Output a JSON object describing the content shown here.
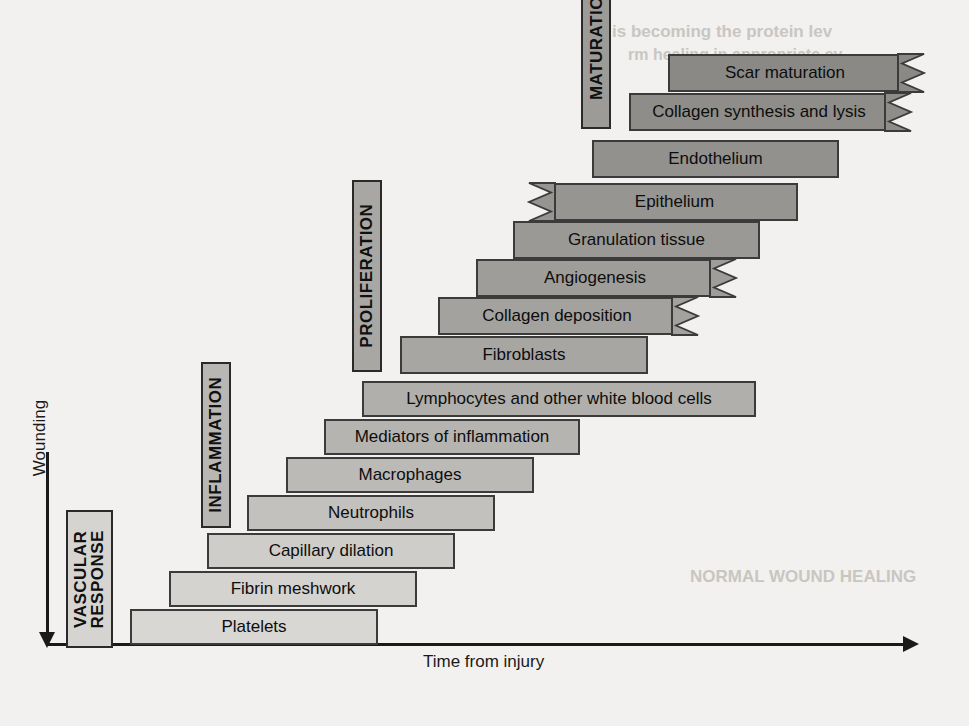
{
  "axes": {
    "y_label": "Wounding",
    "x_label": "Time from injury"
  },
  "phases": [
    {
      "id": "vascular-response",
      "label": "VASCULAR\nRESPONSE",
      "line1": "VASCULAR",
      "line2": "RESPONSE",
      "x": 66,
      "y": 510,
      "w": 47,
      "h": 138,
      "fill": "#d6d4d1",
      "font_size": 17
    },
    {
      "id": "inflammation",
      "label": "INFLAMMATION",
      "line1": "INFLAMMATION",
      "line2": "",
      "x": 201,
      "y": 362,
      "w": 30,
      "h": 166,
      "fill": "#b9b7b4",
      "font_size": 17
    },
    {
      "id": "proliferation",
      "label": "PROLIFERATION",
      "line1": "PROLIFERATION",
      "line2": "",
      "x": 352,
      "y": 180,
      "w": 30,
      "h": 192,
      "fill": "#a9a7a4",
      "font_size": 17
    },
    {
      "id": "maturation",
      "label": "MATURATION",
      "line1": "MATURATION",
      "line2": "",
      "x": 581,
      "y": -46,
      "w": 30,
      "h": 175,
      "fill": "#9d9b98",
      "font_size": 17
    }
  ],
  "chart_data": {
    "type": "bar",
    "xlabel": "Time from injury",
    "ylabel": "Wounding",
    "orientation": "horizontal-gantt",
    "grid": false,
    "legend": "none",
    "note": "Overlapping horizontal bars forming a staircase; bars darken with later stages; zigzag edges denote continuation beyond the plotted range.",
    "categories": [
      "Platelets",
      "Fibrin meshwork",
      "Capillary dilation",
      "Neutrophils",
      "Macrophages",
      "Mediators of inflammation",
      "Lymphocytes and other white blood cells",
      "Fibroblasts",
      "Collagen deposition",
      "Angiogenesis",
      "Granulation tissue",
      "Epithelium",
      "Endothelium",
      "Collagen synthesis and lysis",
      "Scar maturation"
    ],
    "bars": [
      {
        "label": "Platelets",
        "x": 130,
        "y": 609,
        "w": 248,
        "h": 36,
        "fill": "#d9d7d4",
        "font_size": 17,
        "zig_right": false,
        "zig_left": false,
        "phase": "vascular-response"
      },
      {
        "label": "Fibrin meshwork",
        "x": 169,
        "y": 571,
        "w": 248,
        "h": 36,
        "fill": "#d5d3d0",
        "font_size": 17,
        "zig_right": false,
        "zig_left": false,
        "phase": "vascular-response"
      },
      {
        "label": "Capillary dilation",
        "x": 207,
        "y": 533,
        "w": 248,
        "h": 36,
        "fill": "#cfcdc9",
        "font_size": 17,
        "zig_right": false,
        "zig_left": false,
        "phase": "vascular-response"
      },
      {
        "label": "Neutrophils",
        "x": 247,
        "y": 495,
        "w": 248,
        "h": 36,
        "fill": "#c3c1bd",
        "font_size": 17,
        "zig_right": false,
        "zig_left": false,
        "phase": "inflammation"
      },
      {
        "label": "Macrophages",
        "x": 286,
        "y": 457,
        "w": 248,
        "h": 36,
        "fill": "#bcbab6",
        "font_size": 17,
        "zig_right": false,
        "zig_left": false,
        "phase": "inflammation"
      },
      {
        "label": "Mediators of inflammation",
        "x": 324,
        "y": 419,
        "w": 256,
        "h": 36,
        "fill": "#b6b4b0",
        "font_size": 17,
        "zig_right": false,
        "zig_left": false,
        "phase": "inflammation"
      },
      {
        "label": "Lymphocytes and other white blood cells",
        "x": 362,
        "y": 381,
        "w": 394,
        "h": 36,
        "fill": "#b1afab",
        "font_size": 17,
        "zig_right": false,
        "zig_left": false,
        "phase": "inflammation"
      },
      {
        "label": "Fibroblasts",
        "x": 400,
        "y": 336,
        "w": 248,
        "h": 38,
        "fill": "#a8a6a2",
        "font_size": 17,
        "zig_right": false,
        "zig_left": false,
        "phase": "proliferation"
      },
      {
        "label": "Collagen deposition",
        "x": 438,
        "y": 297,
        "w": 238,
        "h": 38,
        "fill": "#a4a29e",
        "font_size": 17,
        "zig_right": true,
        "zig_left": false,
        "phase": "proliferation"
      },
      {
        "label": "Angiogenesis",
        "x": 476,
        "y": 259,
        "w": 238,
        "h": 38,
        "fill": "#9f9d99",
        "font_size": 17,
        "zig_right": true,
        "zig_left": false,
        "phase": "proliferation"
      },
      {
        "label": "Granulation tissue",
        "x": 513,
        "y": 221,
        "w": 247,
        "h": 38,
        "fill": "#9b9995",
        "font_size": 17,
        "zig_right": false,
        "zig_left": false,
        "phase": "proliferation"
      },
      {
        "label": "Epithelium",
        "x": 551,
        "y": 183,
        "w": 247,
        "h": 38,
        "fill": "#979591",
        "font_size": 17,
        "zig_right": false,
        "zig_left": true,
        "phase": "proliferation"
      },
      {
        "label": "Endothelium",
        "x": 592,
        "y": 140,
        "w": 247,
        "h": 38,
        "fill": "#93918d",
        "font_size": 17,
        "zig_right": false,
        "zig_left": false,
        "phase": "maturation"
      },
      {
        "label": "Collagen synthesis and lysis",
        "x": 629,
        "y": 93,
        "w": 260,
        "h": 38,
        "fill": "#8f8d89",
        "font_size": 17,
        "zig_right": true,
        "zig_left": false,
        "phase": "maturation"
      },
      {
        "label": "Scar maturation",
        "x": 668,
        "y": 54,
        "w": 234,
        "h": 38,
        "fill": "#8b8985",
        "font_size": 17,
        "zig_right": true,
        "zig_left": false,
        "phase": "maturation"
      }
    ]
  },
  "bleed_through": [
    {
      "text": "is becoming the protein lev",
      "x": 612,
      "y": 22,
      "size": 17,
      "rot": 0
    },
    {
      "text": "rm healing in appropriate cy",
      "x": 628,
      "y": 46,
      "size": 16,
      "rot": 0
    },
    {
      "text": "NORMAL WOUND HEALING",
      "x": 690,
      "y": 567,
      "size": 17,
      "rot": 0
    }
  ]
}
